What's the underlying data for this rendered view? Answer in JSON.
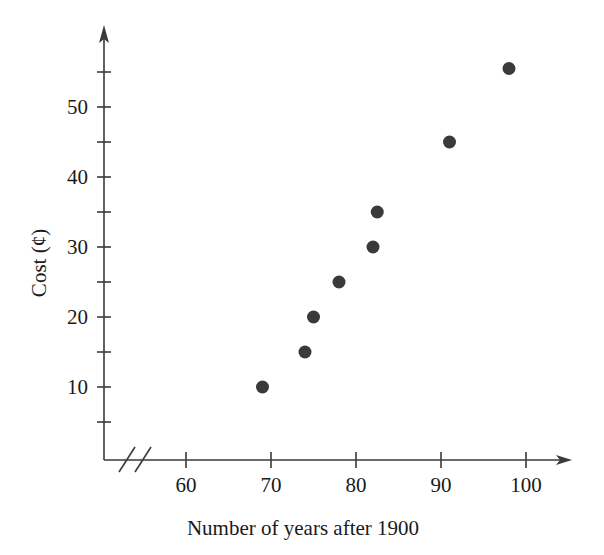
{
  "chart_data": {
    "type": "scatter",
    "title": "",
    "xlabel": "Number of years after 1900",
    "ylabel": "Cost (¢)",
    "xlim": [
      55,
      103
    ],
    "ylim": [
      0,
      58
    ],
    "x_axis_break": true,
    "grid": false,
    "legend": null,
    "x_ticks": [
      60,
      70,
      80,
      90,
      100
    ],
    "x_tick_labels": [
      "60",
      "70",
      "80",
      "90",
      "100"
    ],
    "y_ticks": [
      5,
      10,
      15,
      20,
      25,
      30,
      35,
      40,
      45,
      50,
      55
    ],
    "y_tick_labels": [
      "",
      "10",
      "",
      "20",
      "",
      "30",
      "",
      "40",
      "",
      "50",
      ""
    ],
    "y_labeled_ticks": [
      10,
      20,
      30,
      40,
      50
    ],
    "marker_color": "#3a3a3a",
    "axis_color": "#3a3a3a",
    "points": [
      {
        "x": 69,
        "y": 10
      },
      {
        "x": 74,
        "y": 15
      },
      {
        "x": 75,
        "y": 20
      },
      {
        "x": 78,
        "y": 25
      },
      {
        "x": 82,
        "y": 30
      },
      {
        "x": 82.5,
        "y": 35
      },
      {
        "x": 91,
        "y": 45
      },
      {
        "x": 98,
        "y": 55.5
      }
    ]
  }
}
